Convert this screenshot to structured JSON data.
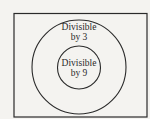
{
  "diagram": {
    "type": "venn",
    "universe": {
      "label": ""
    },
    "sets": [
      {
        "id": "outer",
        "label_line1": "Divisible",
        "label_line2": "by 3"
      },
      {
        "id": "inner",
        "label_line1": "Divisible",
        "label_line2": "by 9"
      }
    ],
    "relationship": "inner set is a subset of outer set",
    "colors": {
      "stroke": "#2a2a2a",
      "background": "#f4f3f0"
    }
  }
}
